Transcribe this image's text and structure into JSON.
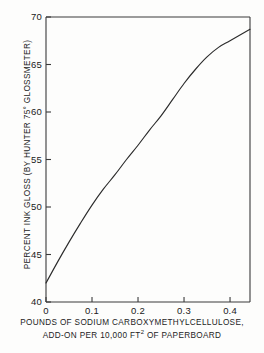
{
  "chart_data": {
    "type": "line",
    "title": "",
    "xlabel": "POUNDS OF SODIUM CARBOXYMETHYLCELLULOSE, ADD-ON PER 10,000 FT2 OF PAPERBOARD",
    "xlabel_line1": "POUNDS OF SODIUM  CARBOXYMETHYLCELLULOSE,",
    "xlabel_line2_pre": "ADD-ON PER  10,000 FT",
    "xlabel_line2_sup": "2",
    "xlabel_line2_post": " OF PAPERBOARD",
    "ylabel": "PERCENT INK GLOSS (BY HUNTER 75° GLOSSMETER)",
    "xlim": [
      0,
      0.4434
    ],
    "ylim": [
      40,
      70
    ],
    "xticks": [
      0,
      0.1,
      0.2,
      0.3,
      0.4
    ],
    "xtick_labels": [
      "0",
      "0.1",
      "0.2",
      "0.3",
      "0.4"
    ],
    "yticks": [
      40,
      45,
      50,
      55,
      60,
      65,
      70
    ],
    "ytick_labels": [
      "40",
      "45",
      "50",
      "55",
      "60",
      "65",
      "70"
    ],
    "grid": false,
    "legend": null,
    "line_color": "#2b2b2b",
    "axis_color": "#3a3a3a",
    "series": [
      {
        "name": "ink gloss vs CMC add-on",
        "x": [
          0.0,
          0.025,
          0.05,
          0.075,
          0.1,
          0.125,
          0.15,
          0.175,
          0.2,
          0.225,
          0.25,
          0.275,
          0.3,
          0.325,
          0.35,
          0.375,
          0.4,
          0.4434
        ],
        "values": [
          42.0,
          44.2,
          46.3,
          48.3,
          50.2,
          51.9,
          53.4,
          55.0,
          56.5,
          58.1,
          59.6,
          61.3,
          63.0,
          64.5,
          65.8,
          66.8,
          67.5,
          68.7
        ]
      }
    ]
  }
}
